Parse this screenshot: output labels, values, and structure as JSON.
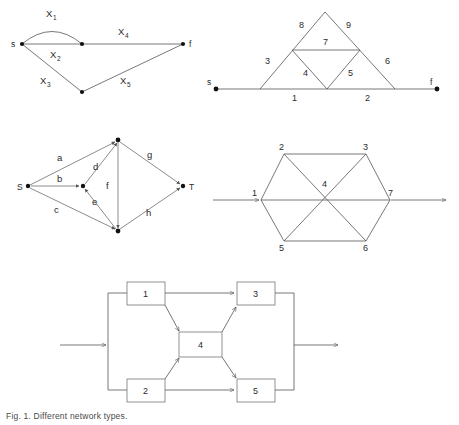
{
  "page": {
    "caption": "Fig. 1. Different network types."
  },
  "figures": [
    {
      "id": "bridge-multigraph",
      "name": "Top-left source-sink multigraph",
      "terminals": {
        "source": "s",
        "sink": "f"
      },
      "edge_labels": [
        "X",
        "X",
        "X",
        "X",
        "X"
      ],
      "edge_subscripts": [
        "1",
        "2",
        "3",
        "4",
        "5"
      ],
      "edges": [
        {
          "label": "X",
          "sub": "1",
          "from": "s",
          "to": "m"
        },
        {
          "label": "X",
          "sub": "2",
          "from": "s",
          "to": "m"
        },
        {
          "label": "X",
          "sub": "3",
          "from": "s",
          "to": "b"
        },
        {
          "label": "X",
          "sub": "4",
          "from": "m",
          "to": "f"
        },
        {
          "label": "X",
          "sub": "5",
          "from": "b",
          "to": "f"
        }
      ]
    },
    {
      "id": "sierpinski-ladder",
      "name": "Top-right triangular lattice network",
      "terminals": {
        "source": "s",
        "sink": "f"
      },
      "edge_labels": [
        "1",
        "2",
        "3",
        "4",
        "5",
        "6",
        "7",
        "8",
        "9"
      ]
    },
    {
      "id": "st-digraph",
      "name": "Middle-left directed S-T network",
      "terminals": {
        "source": "S",
        "sink": "T"
      },
      "edge_labels": [
        "a",
        "b",
        "c",
        "d",
        "e",
        "f",
        "g",
        "h"
      ]
    },
    {
      "id": "hexagon-network",
      "name": "Middle-right hexagonal network",
      "node_labels": [
        "1",
        "2",
        "3",
        "4",
        "5",
        "6",
        "7"
      ]
    },
    {
      "id": "block-diagram",
      "name": "Bottom bridge block diagram",
      "block_labels": [
        "1",
        "2",
        "3",
        "4",
        "5"
      ]
    }
  ],
  "labels": {
    "f1_X1": "X",
    "f1_X1s": "1",
    "f1_X2": "X",
    "f1_X2s": "2",
    "f1_X3": "X",
    "f1_X3s": "3",
    "f1_X4": "X",
    "f1_X4s": "4",
    "f1_X5": "X",
    "f1_X5s": "5",
    "f1_s": "s",
    "f1_f": "f",
    "f2_1": "1",
    "f2_2": "2",
    "f2_3": "3",
    "f2_4": "4",
    "f2_5": "5",
    "f2_6": "6",
    "f2_7": "7",
    "f2_8": "8",
    "f2_9": "9",
    "f2_s": "s",
    "f2_f": "f",
    "f3_a": "a",
    "f3_b": "b",
    "f3_c": "c",
    "f3_d": "d",
    "f3_e": "e",
    "f3_f": "f",
    "f3_g": "g",
    "f3_h": "h",
    "f3_S": "S",
    "f3_T": "T",
    "f4_1": "1",
    "f4_2": "2",
    "f4_3": "3",
    "f4_4": "4",
    "f4_5": "5",
    "f4_6": "6",
    "f4_7": "7",
    "f5_1": "1",
    "f5_2": "2",
    "f5_3": "3",
    "f5_4": "4",
    "f5_5": "5"
  },
  "colors": {
    "line": "#555555",
    "node": "#111111",
    "text": "#2b2b2b",
    "box_stroke": "#777777",
    "background": "#ffffff"
  }
}
